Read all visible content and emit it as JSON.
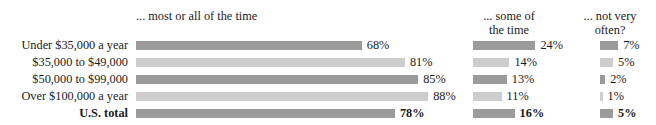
{
  "chart_data": {
    "type": "bar",
    "orientation": "horizontal",
    "title": "",
    "xlabel": "",
    "ylabel": "",
    "grid": false,
    "legend_position": "top-as-column-headers",
    "categories": [
      "Under $35,000 a year",
      "$35,000 to $49,000",
      "$50,000 to $99,000",
      "Over $100,000 a year",
      "U.S. total"
    ],
    "series": [
      {
        "name": "... most or all of the time",
        "values": [
          68,
          81,
          85,
          88,
          78
        ],
        "value_labels": [
          "68%",
          "81%",
          "85%",
          "88%",
          "78%"
        ]
      },
      {
        "name": "... some of the time",
        "values": [
          24,
          14,
          13,
          11,
          16
        ],
        "value_labels": [
          "24%",
          "14%",
          "13%",
          "11%",
          "16%"
        ]
      },
      {
        "name": "... not very often?",
        "values": [
          7,
          5,
          2,
          1,
          5
        ],
        "value_labels": [
          "7%",
          "5%",
          "2%",
          "1%",
          "5%"
        ]
      }
    ],
    "units": "percent",
    "ylim": [
      0,
      100
    ]
  },
  "top_sliver_text": "                                        ",
  "headers": {
    "col1": "... most or all of the time",
    "col2_line1": "... some of",
    "col2_line2": "the time",
    "col3_line1": "... not very",
    "col3_line2": "often?"
  },
  "rows": [
    {
      "label": "Under $35,000 a year",
      "c1": "68%",
      "c2": "24%",
      "c3": "7%",
      "c1v": 68,
      "c2v": 24,
      "c3v": 7,
      "shade": "#9b9b9b"
    },
    {
      "label": "$35,000 to $49,000",
      "c1": "81%",
      "c2": "14%",
      "c3": "5%",
      "c1v": 81,
      "c2v": 14,
      "c3v": 5,
      "shade": "#cdcdcd"
    },
    {
      "label": "$50,000 to $99,000",
      "c1": "85%",
      "c2": "13%",
      "c3": "2%",
      "c1v": 85,
      "c2v": 13,
      "c3v": 2,
      "shade": "#9b9b9b"
    },
    {
      "label": "Over $100,000 a year",
      "c1": "88%",
      "c2": "11%",
      "c3": "1%",
      "c1v": 88,
      "c2v": 11,
      "c3v": 1,
      "shade": "#cdcdcd"
    },
    {
      "label": "U.S. total",
      "c1": "78%",
      "c2": "16%",
      "c3": "5%",
      "c1v": 78,
      "c2v": 16,
      "c3v": 5,
      "shade": "#9b9b9b"
    }
  ],
  "colors": {
    "bar_dark": "#9b9b9b",
    "bar_light": "#cdcdcd",
    "text": "#1b1b1b",
    "background": "#ffffff"
  },
  "layout": {
    "row_tops": [
      38,
      55,
      72,
      89,
      106
    ],
    "g1_left": 136,
    "g1_scale": 3.32,
    "g2_left": 473,
    "g2_scale": 2.6,
    "g3_left": 600,
    "g3_scale": 2.6,
    "value_gap": 5
  }
}
